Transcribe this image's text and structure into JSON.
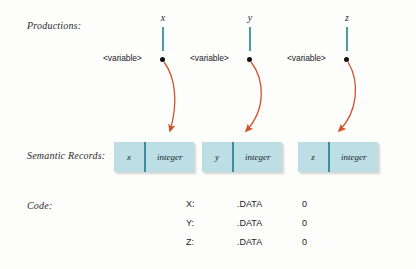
{
  "rows": {
    "productions_label": "Productions:",
    "semantic_label": "Semantic Records:",
    "code_label": "Code:"
  },
  "columns": [
    {
      "variable": "x",
      "production_text": "<variable>",
      "record_name": "x",
      "record_type": "integer"
    },
    {
      "variable": "y",
      "production_text": "<variable>",
      "record_name": "y",
      "record_type": "integer"
    },
    {
      "variable": "z",
      "production_text": "<variable>",
      "record_name": "z",
      "record_type": "integer"
    }
  ],
  "code": {
    "rows": [
      {
        "label": "X:",
        "directive": ".DATA",
        "value": "0"
      },
      {
        "label": "Y:",
        "directive": ".DATA",
        "value": "0"
      },
      {
        "label": "Z:",
        "directive": ".DATA",
        "value": "0"
      }
    ]
  },
  "colors": {
    "stem": "#4c9a9c",
    "arrow": "#d2522a",
    "record_fill": "#bcdee4",
    "record_divider": "#3d8c9c",
    "text": "#2b2b2b",
    "background": "#fdfdfc"
  }
}
